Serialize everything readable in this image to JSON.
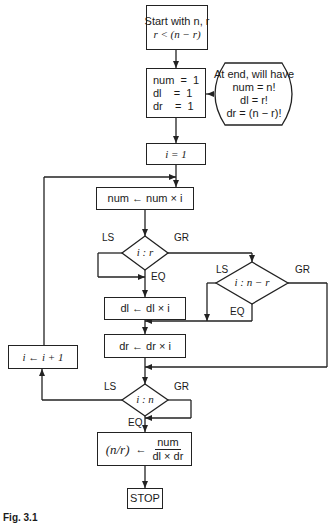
{
  "figure": {
    "caption": "Fig. 3.1",
    "start": {
      "line1": "Start with n, r",
      "line2": "r < (n − r)"
    },
    "init": {
      "lines": [
        "num  =  1",
        "dl    =  1",
        "dr    =  1"
      ]
    },
    "note": {
      "lines": [
        "At end, will have",
        "num = n!",
        "dl = r!",
        "dr = (n − r)!"
      ]
    },
    "set_i": "i = 1",
    "num_step": "num ← num × i",
    "dec_i_r": {
      "text": "i : r",
      "ls": "LS",
      "gr": "GR",
      "eq": "EQ"
    },
    "dec_i_nr": {
      "text": "i : n − r",
      "ls": "LS",
      "gr": "GR",
      "eq": "EQ"
    },
    "dl_step": "dl ← dl × i",
    "dr_step": "dr ← dr × i",
    "inc_i": "i ← i + 1",
    "dec_i_n": {
      "text": "i : n",
      "ls": "LS",
      "gr": "GR",
      "eq": "EQ"
    },
    "result": {
      "lhs": "(n/r)",
      "arrow": "←",
      "numerator": "num",
      "denominator": "dl × dr"
    },
    "stop": "STOP"
  }
}
